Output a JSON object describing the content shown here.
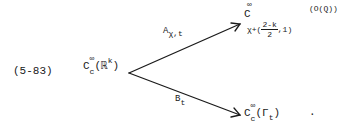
{
  "equation": {
    "number": "(5-83)",
    "source": {
      "base": "C",
      "sup": "∞",
      "sub": "c",
      "open": "(",
      "space": "ℝ",
      "space_sup": "k",
      "close": ")"
    },
    "upper_map": {
      "label_base": "A",
      "label_sub": "χ,t",
      "target": {
        "base": "C",
        "sup": "∞",
        "sub_prefix": "χ+(",
        "frac_num": "2-k",
        "frac_den": "2",
        "sub_suffix": ",1)",
        "argument": "(O(Q))"
      }
    },
    "lower_map": {
      "label_base": "B",
      "label_sub": "t",
      "target": {
        "base": "C",
        "sup": "∞",
        "sub": "c",
        "open": "(",
        "gamma": "Γ",
        "gamma_sub": "t",
        "close": ")"
      }
    },
    "trailing_punct": "."
  },
  "colors": {
    "ink": "#1a1a1a",
    "background": "#ffffff"
  }
}
